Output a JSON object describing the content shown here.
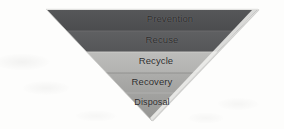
{
  "diagram": {
    "name": "inverted-pyramid-waste-hierarchy",
    "shape": "inverted-triangle-funnel",
    "background_color": "#fdfdfc",
    "outline_color": "#d9d9d7",
    "label_color": "#2b2b2b",
    "geometry": {
      "top_left_x": 46,
      "top_right_x": 258,
      "top_y": 9,
      "apex_x": 152,
      "apex_y": 121
    },
    "levels": [
      {
        "index": 1,
        "label": "Prevention",
        "color": "#4f5052",
        "band_top": 9,
        "band_bottom": 31,
        "label_center_x": 170,
        "label_center_y": 20
      },
      {
        "index": 2,
        "label": "Recuse",
        "color": "#5a5b5d",
        "band_top": 31,
        "band_bottom": 52,
        "label_center_x": 162,
        "label_center_y": 41
      },
      {
        "index": 3,
        "label": "Recycle",
        "color": "#b9b9b7",
        "band_top": 52,
        "band_bottom": 73,
        "label_center_x": 156,
        "label_center_y": 62
      },
      {
        "index": 4,
        "label": "Recovery",
        "color": "#a9a9a7",
        "band_top": 73,
        "band_bottom": 93,
        "label_center_x": 152,
        "label_center_y": 83
      },
      {
        "index": 5,
        "label": "Disposal",
        "color": "#9d9d9b",
        "band_top": 93,
        "band_bottom": 121,
        "label_center_x": 152,
        "label_center_y": 104
      }
    ]
  }
}
